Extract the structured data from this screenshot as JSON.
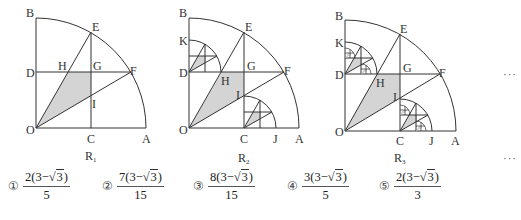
{
  "figures": [
    {
      "id": "R1",
      "caption": "R",
      "caption_sub": "1",
      "points": {
        "B": "B",
        "E": "E",
        "D": "D",
        "H": "H",
        "G": "G",
        "F": "F",
        "I": "I",
        "O": "O",
        "C": "C",
        "A": "A"
      }
    },
    {
      "id": "R2",
      "caption": "R",
      "caption_sub": "2",
      "points": {
        "B": "B",
        "E": "E",
        "K": "K",
        "D": "D",
        "H": "H",
        "G": "G",
        "F": "F",
        "I": "I",
        "O": "O",
        "C": "C",
        "J": "J",
        "A": "A"
      }
    },
    {
      "id": "R3",
      "caption": "R",
      "caption_sub": "3",
      "points": {
        "B": "B",
        "E": "E",
        "K": "K",
        "D": "D",
        "H": "H",
        "G": "G",
        "F": "F",
        "I": "I",
        "O": "O",
        "C": "C",
        "J": "J",
        "A": "A"
      }
    }
  ],
  "continuation": {
    "figure_row": "···",
    "caption_row": "···"
  },
  "choices": [
    {
      "marker": "①",
      "numerator_coef": "2",
      "inner": "3−",
      "radicand": "3",
      "denominator": "5"
    },
    {
      "marker": "②",
      "numerator_coef": "7",
      "inner": "3−",
      "radicand": "3",
      "denominator": "15"
    },
    {
      "marker": "③",
      "numerator_coef": "8",
      "inner": "3−",
      "radicand": "3",
      "denominator": "15"
    },
    {
      "marker": "④",
      "numerator_coef": "3",
      "inner": "3−",
      "radicand": "3",
      "denominator": "5"
    },
    {
      "marker": "⑤",
      "numerator_coef": "2",
      "inner": "3−",
      "radicand": "3",
      "denominator": "3"
    }
  ],
  "colors": {
    "stroke": "#333333",
    "shade": "#d4d4d4",
    "text": "#333333"
  }
}
